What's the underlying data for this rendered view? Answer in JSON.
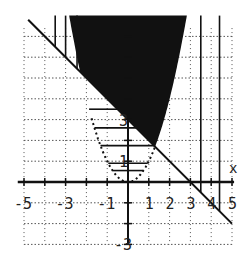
{
  "chart_data": {
    "type": "region-plot",
    "title": "",
    "xlabel": "x",
    "ylabel": "",
    "xlim": [
      -5,
      5
    ],
    "ylim": [
      -3,
      8
    ],
    "grid": true,
    "curves": [
      {
        "name": "line",
        "equation": "y = 3 - x",
        "style": "solid"
      },
      {
        "name": "parabola",
        "equation": "y = x^2",
        "style": "dotted"
      }
    ],
    "shaded_regions": [
      {
        "name": "solution",
        "description": "y >= x^2 and y >= 3 - x",
        "fill": "solid-black"
      },
      {
        "name": "parabola-interior",
        "description": "y >= x^2, below line",
        "fill": "horizontal-hatch"
      },
      {
        "name": "line-upper",
        "description": "above line, outside parabola",
        "fill": "vertical-hatch"
      }
    ],
    "x_tick_labels": [
      "-5",
      "-3",
      "-1",
      "1",
      "2",
      "3",
      "4",
      "5"
    ],
    "y_tick_labels": [
      "1",
      "3",
      "-3"
    ],
    "intersection": {
      "x": 1.3,
      "y": 1.7
    }
  },
  "colors": {
    "ink": "#111111",
    "grid": "#555555",
    "background": "#ffffff"
  }
}
